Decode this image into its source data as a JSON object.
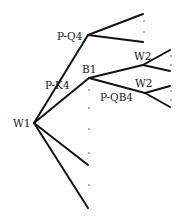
{
  "diagram": {
    "type": "game-tree",
    "labels": {
      "root": "W1",
      "move_pk4": "P-K4",
      "move_pq4": "P-Q4",
      "node_b1": "B1",
      "node_w2_upper": "W2",
      "node_w2_lower": "W2",
      "move_pqb4": "P-QB4"
    },
    "colors": {
      "line": "#141414",
      "text": "#1a1a1a",
      "background": "#ffffff"
    }
  }
}
